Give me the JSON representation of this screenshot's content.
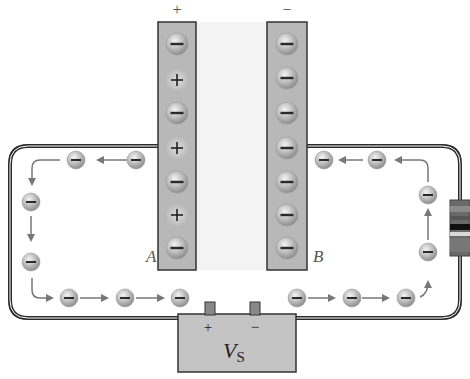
{
  "diagram": {
    "top_labels": {
      "left_plate_sign": "+",
      "right_plate_sign": "−"
    },
    "plate_labels": {
      "left": "A",
      "right": "B"
    },
    "left_plate_charges": [
      "−",
      "+",
      "−",
      "+",
      "−",
      "+",
      "−"
    ],
    "right_plate_charges": [
      "−",
      "−",
      "−",
      "−",
      "−",
      "−",
      "−"
    ],
    "battery": {
      "label_main": "V",
      "label_sub": "S",
      "positive_terminal": "+",
      "negative_terminal": "−"
    },
    "electron_symbol": "−",
    "components": {
      "resistor": "resistor-on-right-wire"
    },
    "colors": {
      "plate_fill": "#b8b8b8",
      "plate_border": "#333333",
      "gap_fill": "#f3f3f3",
      "wire": "#2a2a2a",
      "electron": "#b5b5b5",
      "arrow": "#777777",
      "battery_fill": "#c4c4c4"
    }
  }
}
